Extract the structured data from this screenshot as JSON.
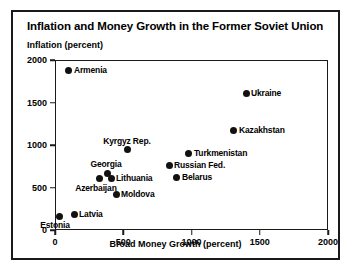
{
  "chart_data": {
    "type": "scatter",
    "title": "Inflation and Money Growth in the Former Soviet Union",
    "subtitle": "",
    "xlabel": "Broad Money Growth (percent)",
    "ylabel": "Inflation (percent)",
    "xlim": [
      0,
      2000
    ],
    "ylim": [
      0,
      2000
    ],
    "xticks": [
      0,
      500,
      1000,
      1500,
      2000
    ],
    "yticks": [
      0,
      500,
      1000,
      1500,
      2000
    ],
    "grid": false,
    "legend": "none",
    "marker": "filled-circle",
    "marker_color": "#111111",
    "points": [
      {
        "name": "Armenia",
        "x": 95,
        "y": 1894,
        "label_pos": "right"
      },
      {
        "name": "Ukraine",
        "x": 1392,
        "y": 1612,
        "label_pos": "right"
      },
      {
        "name": "Kazakhstan",
        "x": 1304,
        "y": 1188,
        "label_pos": "right"
      },
      {
        "name": "Kyrgyz Rep.",
        "x": 527,
        "y": 953,
        "label_pos": "above"
      },
      {
        "name": "Turkmenistan",
        "x": 974,
        "y": 906,
        "label_pos": "right"
      },
      {
        "name": "Russian Fed.",
        "x": 828,
        "y": 765,
        "label_pos": "right"
      },
      {
        "name": "Georgia",
        "x": 374,
        "y": 682,
        "label_pos": "above"
      },
      {
        "name": "Belarus",
        "x": 886,
        "y": 635,
        "label_pos": "right"
      },
      {
        "name": "Lithuania",
        "x": 403,
        "y": 612,
        "label_pos": "right"
      },
      {
        "name": "Azerbaijan",
        "x": 322,
        "y": 612,
        "label_pos": "below"
      },
      {
        "name": "Moldova",
        "x": 440,
        "y": 424,
        "label_pos": "right"
      },
      {
        "name": "Latvia",
        "x": 132,
        "y": 200,
        "label_pos": "right"
      },
      {
        "name": "Estonia",
        "x": 22,
        "y": 176,
        "label_pos": "below"
      }
    ]
  }
}
